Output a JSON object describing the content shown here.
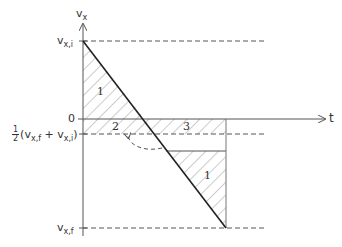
{
  "diagram": {
    "axes": {
      "y_label": "v",
      "y_label_sub": "x",
      "x_label": "t",
      "origin_label": "0"
    },
    "levels": {
      "initial": {
        "main": "v",
        "sub": "x,i"
      },
      "final": {
        "main": "v",
        "sub": "x,f"
      },
      "average": {
        "frac_num": "1",
        "frac_den": "2",
        "text_open": "(v",
        "sub1": "x,f",
        "plus": " + v",
        "sub2": "x,i",
        "text_close": ")"
      }
    },
    "regions": [
      {
        "id": "1-upper",
        "label": "1"
      },
      {
        "id": "2",
        "label": "2"
      },
      {
        "id": "3",
        "label": "3"
      },
      {
        "id": "1-lower",
        "label": "1"
      }
    ],
    "colors": {
      "line": "#222222",
      "axis": "#555555",
      "hatch": "#999999",
      "dash": "#555555"
    }
  }
}
